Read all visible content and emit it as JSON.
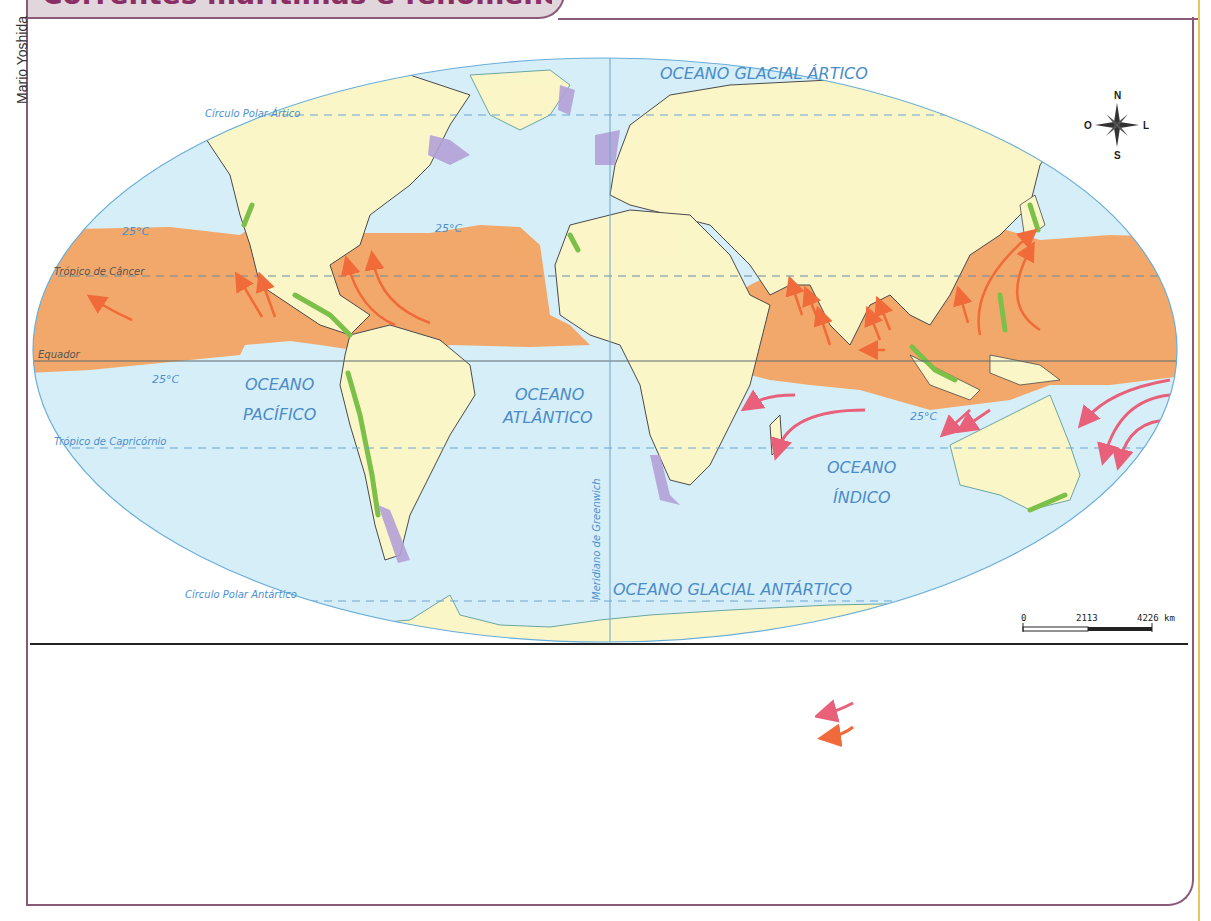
{
  "header": {
    "title": "Correntes marítimas e fenômenos climáticos",
    "credit": "Mario Yoshida"
  },
  "map": {
    "compass": {
      "north": "N",
      "south": "S",
      "east": "L",
      "west": "O"
    },
    "scale": {
      "start": "0",
      "mid": "2113",
      "end": "4226 km"
    },
    "lines": {
      "arctic_circle": "Círculo Polar Ártico",
      "tropic_cancer": "Trópico de Câncer",
      "equator": "Equador",
      "tropic_capricorn": "Trópico de Capricórnio",
      "antarctic_circle": "Círculo Polar Antártico",
      "greenwich": "Meridiano de Greenwich"
    },
    "oceans": {
      "arctic": "OCEANO GLACIAL ÁRTICO",
      "pacific_line1": "OCEANO",
      "pacific_line2": "PACÍFICO",
      "atlantic_line1": "OCEANO",
      "atlantic_line2": "ATLÂNTICO",
      "indian_line1": "OCEANO",
      "indian_line2": "ÍNDICO",
      "antarctic": "OCEANO GLACIAL ANTÁRTICO"
    },
    "isotherm_labels": [
      "25°C",
      "25°C",
      "25°C",
      "25°C"
    ],
    "colors": {
      "ocean": "#d6eef8",
      "land": "#fbf6c8",
      "warm_zone": "#f2a86a",
      "green_coast": "#7cc04a",
      "purple_coast": "#b3a0d6",
      "arrow_orange": "#f06a3a",
      "arrow_pink": "#e8607a"
    }
  },
  "legend": {
    "items": [
      {
        "name": "pink-arrow",
        "color": "#e8607a"
      },
      {
        "name": "orange-arrow",
        "color": "#f06a3a"
      }
    ]
  }
}
